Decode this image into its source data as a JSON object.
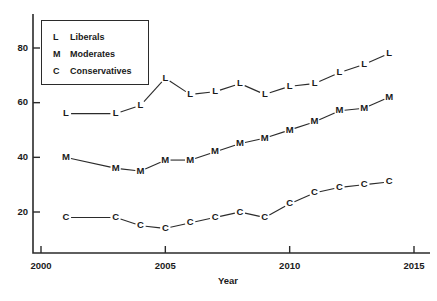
{
  "chart_data": {
    "type": "line",
    "title": "",
    "xlabel": "Year",
    "ylabel": "",
    "xlim": [
      2000,
      2015
    ],
    "ylim": [
      0,
      90
    ],
    "grid": false,
    "legend_position": "top-left",
    "x_ticks": [
      2000,
      2005,
      2010,
      2015
    ],
    "y_ticks": [
      20,
      40,
      60,
      80
    ],
    "x": [
      2001,
      2003,
      2004,
      2005,
      2006,
      2007,
      2008,
      2009,
      2010,
      2011,
      2012,
      2013,
      2014
    ],
    "series": [
      {
        "name": "Liberals",
        "marker": "L",
        "values": [
          56,
          56,
          59,
          69,
          63,
          64,
          67,
          63,
          66,
          67,
          71,
          74,
          78
        ]
      },
      {
        "name": "Moderates",
        "marker": "M",
        "values": [
          40,
          36,
          35,
          39,
          39,
          42,
          45,
          47,
          50,
          53,
          57,
          58,
          62
        ]
      },
      {
        "name": "Conservatives",
        "marker": "C",
        "values": [
          18,
          18,
          15,
          14,
          16,
          18,
          20,
          18,
          23,
          27,
          29,
          30,
          31
        ]
      }
    ]
  },
  "legend": {
    "entries": [
      {
        "key": "L",
        "label": "Liberals"
      },
      {
        "key": "M",
        "label": "Moderates"
      },
      {
        "key": "C",
        "label": "Conservatives"
      }
    ]
  },
  "axis": {
    "x_title": "Year",
    "x_tick_labels": [
      "2000",
      "2005",
      "2010",
      "2015"
    ],
    "y_tick_labels": [
      "20",
      "40",
      "60",
      "80"
    ]
  },
  "colors": {
    "ink": "#2b2b2b",
    "background": "#ffffff"
  }
}
